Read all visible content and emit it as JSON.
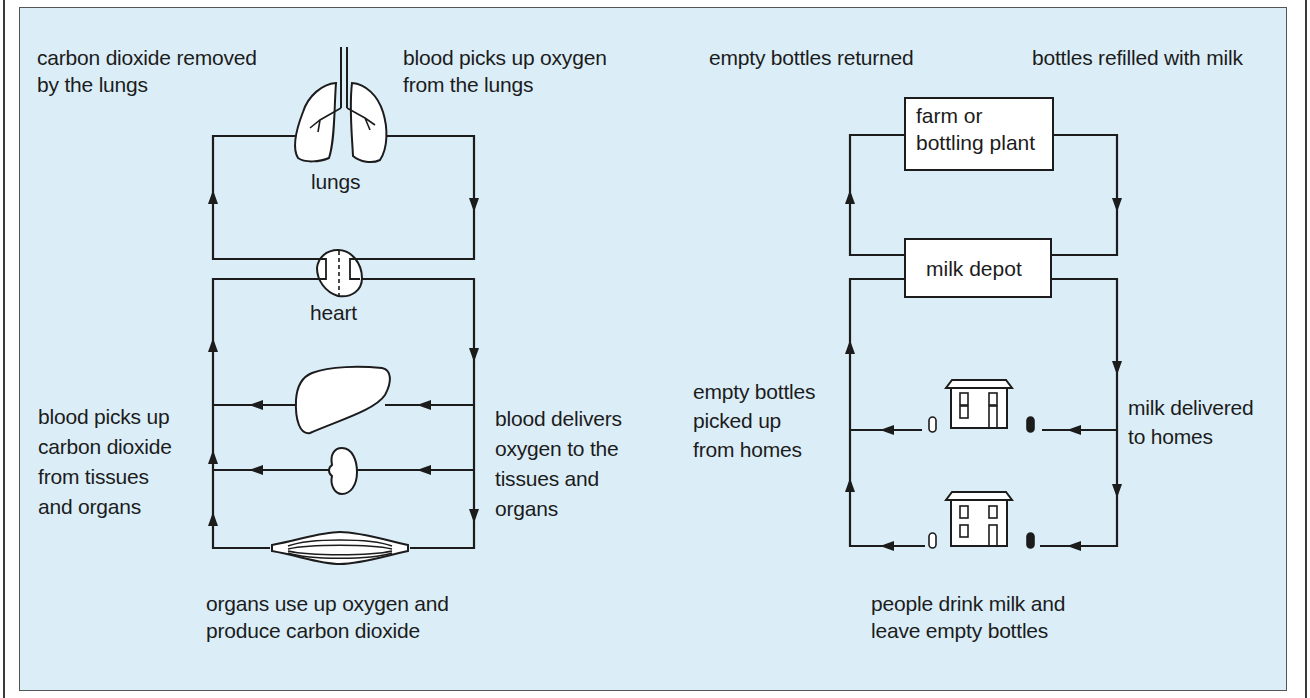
{
  "colors": {
    "panel_background": "#dbeef8",
    "line": "#1c1c1c",
    "organ_fill": "#ffffff"
  },
  "left_diagram": {
    "title": "Blood circulation",
    "labels": {
      "top_left": "carbon dioxide removed\nby the lungs",
      "top_right": "blood picks up oxygen\nfrom the  lungs",
      "lungs": "lungs",
      "heart": "heart",
      "mid_left": "blood picks up\ncarbon dioxide\nfrom tissues\nand organs",
      "mid_right": "blood delivers\noxygen to the\ntissues and\norgans",
      "bottom": "organs use up oxygen and\nproduce carbon dioxide"
    },
    "nodes": [
      {
        "id": "lungs",
        "icon": "lungs-icon"
      },
      {
        "id": "heart",
        "icon": "heart-icon"
      },
      {
        "id": "liver",
        "icon": "liver-icon"
      },
      {
        "id": "kidney",
        "icon": "kidney-icon"
      },
      {
        "id": "muscle",
        "icon": "muscle-icon"
      }
    ]
  },
  "right_diagram": {
    "title": "Milk bottle cycle",
    "labels": {
      "top_left": "empty bottles returned",
      "top_right": "bottles refilled with milk",
      "mid_left": "empty bottles\npicked up\nfrom homes",
      "mid_right": "milk delivered\nto homes",
      "bottom": "people drink milk and\nleave empty bottles"
    },
    "boxes": {
      "farm": "farm or\nbottling plant",
      "depot": "milk depot"
    },
    "nodes": [
      {
        "id": "house-1",
        "icon": "house-icon"
      },
      {
        "id": "house-2",
        "icon": "house-icon"
      }
    ]
  }
}
